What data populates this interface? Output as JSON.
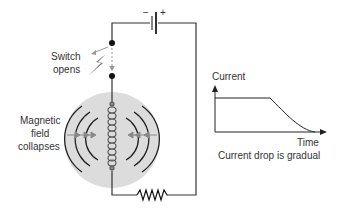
{
  "labels": {
    "switch_line1": "Switch",
    "switch_line2": "opens",
    "field_line1": "Magnetic",
    "field_line2": "field",
    "field_line3": "collapses",
    "battery_minus": "−",
    "battery_plus": "+"
  },
  "graph": {
    "ylabel": "Current",
    "xlabel": "Time",
    "caption": "Current drop is gradual"
  },
  "chart_data": {
    "type": "line",
    "title": "",
    "xlabel": "Time",
    "ylabel": "Current",
    "caption": "Current drop is gradual",
    "series": [
      {
        "name": "Current",
        "points": [
          [
            0,
            1.0
          ],
          [
            0.55,
            1.0
          ],
          [
            0.7,
            0.6
          ],
          [
            0.85,
            0.25
          ],
          [
            1.0,
            0.0
          ]
        ]
      }
    ]
  },
  "colors": {
    "wire": "#333333",
    "field_disc": "#d9d9d9",
    "coil": "#555555",
    "arrow": "#888888"
  }
}
